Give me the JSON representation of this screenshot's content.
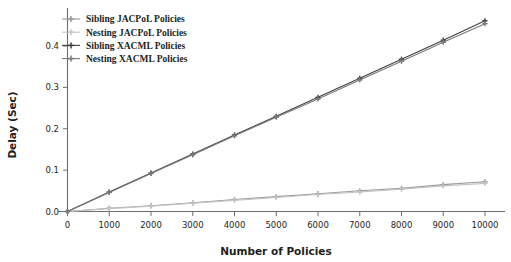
{
  "chart_data": {
    "type": "line",
    "title": "",
    "xlabel": "Number of Policies",
    "ylabel": "Delay (Sec)",
    "x": [
      0,
      1000,
      2000,
      3000,
      4000,
      5000,
      6000,
      7000,
      8000,
      9000,
      10000
    ],
    "xlim": [
      0,
      10000
    ],
    "ylim": [
      0.0,
      0.47
    ],
    "xticks": [
      0,
      1000,
      2000,
      3000,
      4000,
      5000,
      6000,
      7000,
      8000,
      9000,
      10000
    ],
    "xticklabels": [
      "0",
      "1000",
      "2000",
      "3000",
      "4000",
      "5000",
      "6000",
      "7000",
      "8000",
      "9000",
      "10000"
    ],
    "yticks": [
      0.0,
      0.1,
      0.2,
      0.3,
      0.4
    ],
    "yticklabels": [
      "0.0",
      "0.1",
      "0.2",
      "0.3",
      "0.4"
    ],
    "grid": false,
    "legend_position": "upper left",
    "marker": "plus",
    "series": [
      {
        "name": "Sibling JACPoL Policies",
        "color": "#9a9a9a",
        "values": [
          0.0,
          0.008,
          0.014,
          0.021,
          0.029,
          0.036,
          0.043,
          0.05,
          0.056,
          0.065,
          0.072
        ]
      },
      {
        "name": "Nesting JACPoL Policies",
        "color": "#c4c4c4",
        "values": [
          0.0,
          0.007,
          0.013,
          0.02,
          0.027,
          0.034,
          0.041,
          0.047,
          0.054,
          0.062,
          0.068
        ]
      },
      {
        "name": "Sibling XACML Policies",
        "color": "#3f3f3f",
        "values": [
          0.0,
          0.047,
          0.093,
          0.139,
          0.185,
          0.23,
          0.276,
          0.322,
          0.368,
          0.414,
          0.461
        ]
      },
      {
        "name": "Nesting XACML Policies",
        "color": "#7a7a7a",
        "values": [
          0.0,
          0.046,
          0.092,
          0.137,
          0.183,
          0.228,
          0.272,
          0.318,
          0.363,
          0.409,
          0.454
        ]
      }
    ]
  },
  "legend": {
    "items": [
      {
        "label": "Sibling JACPoL Policies"
      },
      {
        "label": "Nesting JACPoL Policies"
      },
      {
        "label": "Sibling XACML Policies"
      },
      {
        "label": "Nesting XACML Policies"
      }
    ]
  },
  "axes": {
    "x_title": "Number of Policies",
    "y_title": "Delay (Sec)"
  }
}
